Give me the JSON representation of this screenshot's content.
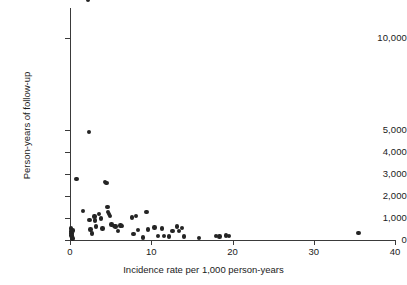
{
  "chart_data": {
    "type": "scatter",
    "title": "",
    "xlabel": "Incidence rate per 1,000 person-years",
    "ylabel": "Person-years of follow-up",
    "xlim": [
      0,
      40
    ],
    "ylim": [
      0,
      12000
    ],
    "grid": false,
    "legend": null,
    "x_ticks": [
      0,
      10,
      20,
      30,
      40
    ],
    "x_tick_labels": [
      "0",
      "10",
      "20",
      "30",
      "40"
    ],
    "y_ticks": [
      0,
      1000,
      2000,
      3000,
      4000,
      5000,
      10000
    ],
    "y_tick_labels": [
      "0",
      "1,000",
      "2,000",
      "3,000",
      "4,000",
      "5,000",
      "10,000"
    ],
    "y_axis_note": "broken scale: linear 0-5,000 then compressed gap to 10,000",
    "marker": "filled-circle",
    "marker_color": "#242424",
    "points": [
      {
        "x": 0.1,
        "y": 520
      },
      {
        "x": 0.15,
        "y": 380
      },
      {
        "x": 0.2,
        "y": 300
      },
      {
        "x": 0.2,
        "y": 200
      },
      {
        "x": 0.25,
        "y": 120
      },
      {
        "x": 0.3,
        "y": 60
      },
      {
        "x": 0.35,
        "y": 430
      },
      {
        "x": 0.8,
        "y": 2780
      },
      {
        "x": 1.6,
        "y": 1320
      },
      {
        "x": 2.2,
        "y": 11900
      },
      {
        "x": 2.3,
        "y": 4900
      },
      {
        "x": 2.4,
        "y": 900
      },
      {
        "x": 2.5,
        "y": 480
      },
      {
        "x": 2.7,
        "y": 300
      },
      {
        "x": 3.0,
        "y": 1060
      },
      {
        "x": 3.1,
        "y": 880
      },
      {
        "x": 3.2,
        "y": 620
      },
      {
        "x": 3.6,
        "y": 1180
      },
      {
        "x": 3.8,
        "y": 980
      },
      {
        "x": 4.0,
        "y": 520
      },
      {
        "x": 4.3,
        "y": 2640
      },
      {
        "x": 4.5,
        "y": 2600
      },
      {
        "x": 4.6,
        "y": 1500
      },
      {
        "x": 4.7,
        "y": 1280
      },
      {
        "x": 4.8,
        "y": 1180
      },
      {
        "x": 4.9,
        "y": 1100
      },
      {
        "x": 5.1,
        "y": 700
      },
      {
        "x": 5.4,
        "y": 640
      },
      {
        "x": 5.6,
        "y": 620
      },
      {
        "x": 5.9,
        "y": 420
      },
      {
        "x": 6.2,
        "y": 660
      },
      {
        "x": 6.4,
        "y": 640
      },
      {
        "x": 7.6,
        "y": 1020
      },
      {
        "x": 7.8,
        "y": 260
      },
      {
        "x": 8.1,
        "y": 1080
      },
      {
        "x": 8.4,
        "y": 460
      },
      {
        "x": 9.0,
        "y": 120
      },
      {
        "x": 9.4,
        "y": 1260
      },
      {
        "x": 9.6,
        "y": 480
      },
      {
        "x": 10.4,
        "y": 560
      },
      {
        "x": 10.8,
        "y": 180
      },
      {
        "x": 11.3,
        "y": 520
      },
      {
        "x": 11.6,
        "y": 180
      },
      {
        "x": 12.2,
        "y": 160
      },
      {
        "x": 12.6,
        "y": 420
      },
      {
        "x": 13.2,
        "y": 620
      },
      {
        "x": 13.4,
        "y": 400
      },
      {
        "x": 13.8,
        "y": 540
      },
      {
        "x": 14.0,
        "y": 160
      },
      {
        "x": 15.9,
        "y": 80
      },
      {
        "x": 18.0,
        "y": 180
      },
      {
        "x": 18.4,
        "y": 160
      },
      {
        "x": 19.2,
        "y": 200
      },
      {
        "x": 19.6,
        "y": 180
      },
      {
        "x": 35.5,
        "y": 320
      }
    ]
  }
}
